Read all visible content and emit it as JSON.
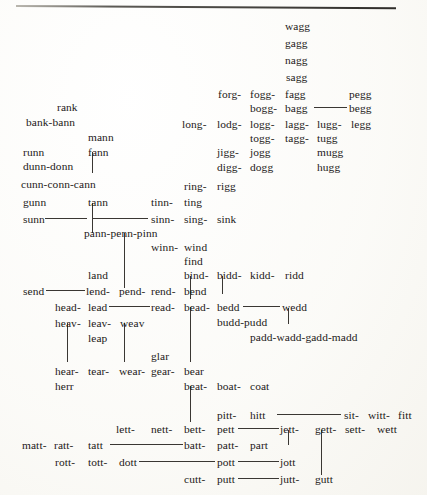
{
  "page": {
    "kind": "scanned-book-diagram",
    "width": 427,
    "height": 495,
    "ink_color": "#232018",
    "rule_color": "#3a3733",
    "paper_color": "#fdfdfb"
  },
  "top_rule": {
    "present": true,
    "x": 16,
    "y": 5,
    "width": 380
  },
  "words": [
    {
      "t": "wagg",
      "x": 285,
      "y": 20
    },
    {
      "t": "gagg",
      "x": 285,
      "y": 37
    },
    {
      "t": "nagg",
      "x": 285,
      "y": 54
    },
    {
      "t": "sagg",
      "x": 286,
      "y": 71
    },
    {
      "t": "forg-",
      "x": 218,
      "y": 88
    },
    {
      "t": "fogg-",
      "x": 250,
      "y": 88
    },
    {
      "t": "fagg",
      "x": 285,
      "y": 88
    },
    {
      "t": "pegg",
      "x": 349,
      "y": 88
    },
    {
      "t": "rank",
      "x": 57,
      "y": 101
    },
    {
      "t": "bogg-",
      "x": 250,
      "y": 102
    },
    {
      "t": "bagg",
      "x": 285,
      "y": 102
    },
    {
      "t": "begg",
      "x": 349,
      "y": 102
    },
    {
      "t": "bank-bann",
      "x": 26,
      "y": 116
    },
    {
      "t": "long-",
      "x": 182,
      "y": 118
    },
    {
      "t": "lodg-",
      "x": 217,
      "y": 118
    },
    {
      "t": "logg-",
      "x": 250,
      "y": 118
    },
    {
      "t": "lagg-",
      "x": 285,
      "y": 118
    },
    {
      "t": "lugg-",
      "x": 317,
      "y": 118
    },
    {
      "t": "legg",
      "x": 351,
      "y": 118
    },
    {
      "t": "mann",
      "x": 88,
      "y": 131
    },
    {
      "t": "togg-",
      "x": 250,
      "y": 132
    },
    {
      "t": "tagg-",
      "x": 285,
      "y": 132
    },
    {
      "t": "tugg",
      "x": 317,
      "y": 132
    },
    {
      "t": "runn",
      "x": 23,
      "y": 146
    },
    {
      "t": "fann",
      "x": 88,
      "y": 146
    },
    {
      "t": "jigg-",
      "x": 217,
      "y": 146
    },
    {
      "t": "jogg",
      "x": 250,
      "y": 146
    },
    {
      "t": "mugg",
      "x": 317,
      "y": 146
    },
    {
      "t": "dunn-donn",
      "x": 23,
      "y": 160
    },
    {
      "t": "digg-",
      "x": 217,
      "y": 161
    },
    {
      "t": "dogg",
      "x": 250,
      "y": 161
    },
    {
      "t": "hugg",
      "x": 317,
      "y": 161
    },
    {
      "t": "cunn-conn-cann",
      "x": 21,
      "y": 178
    },
    {
      "t": "ring-",
      "x": 184,
      "y": 180
    },
    {
      "t": "rigg",
      "x": 217,
      "y": 180
    },
    {
      "t": "gunn",
      "x": 23,
      "y": 196
    },
    {
      "t": "tann",
      "x": 88,
      "y": 196
    },
    {
      "t": "tinn-",
      "x": 151,
      "y": 196
    },
    {
      "t": "ting",
      "x": 184,
      "y": 196
    },
    {
      "t": "sunn",
      "x": 23,
      "y": 213
    },
    {
      "t": "sinn-",
      "x": 151,
      "y": 213
    },
    {
      "t": "sing-",
      "x": 184,
      "y": 213
    },
    {
      "t": "sink",
      "x": 217,
      "y": 213
    },
    {
      "t": "pann-penn-pinn",
      "x": 84,
      "y": 227
    },
    {
      "t": "winn-",
      "x": 151,
      "y": 241
    },
    {
      "t": "wind",
      "x": 184,
      "y": 241
    },
    {
      "t": "find",
      "x": 184,
      "y": 255
    },
    {
      "t": "land",
      "x": 88,
      "y": 269
    },
    {
      "t": "bind-",
      "x": 184,
      "y": 269
    },
    {
      "t": "bidd-",
      "x": 217,
      "y": 269
    },
    {
      "t": "kidd-",
      "x": 250,
      "y": 269
    },
    {
      "t": "ridd",
      "x": 285,
      "y": 269
    },
    {
      "t": "send",
      "x": 23,
      "y": 285
    },
    {
      "t": "lend-",
      "x": 86,
      "y": 285
    },
    {
      "t": "pend-",
      "x": 119,
      "y": 285
    },
    {
      "t": "rend-",
      "x": 151,
      "y": 285
    },
    {
      "t": "bend",
      "x": 184,
      "y": 285
    },
    {
      "t": "head-",
      "x": 55,
      "y": 301
    },
    {
      "t": "lead",
      "x": 88,
      "y": 301
    },
    {
      "t": "read-",
      "x": 151,
      "y": 301
    },
    {
      "t": "bead-",
      "x": 184,
      "y": 301
    },
    {
      "t": "bedd",
      "x": 217,
      "y": 301
    },
    {
      "t": "wedd",
      "x": 282,
      "y": 301
    },
    {
      "t": "heav-",
      "x": 55,
      "y": 317
    },
    {
      "t": "leav-",
      "x": 88,
      "y": 317
    },
    {
      "t": "weav",
      "x": 120,
      "y": 317
    },
    {
      "t": "budd-pudd",
      "x": 217,
      "y": 316
    },
    {
      "t": "leap",
      "x": 88,
      "y": 332
    },
    {
      "t": "padd-wadd-gadd-madd",
      "x": 250,
      "y": 331
    },
    {
      "t": "glar",
      "x": 151,
      "y": 350
    },
    {
      "t": "hear-",
      "x": 55,
      "y": 365
    },
    {
      "t": "tear-",
      "x": 88,
      "y": 365
    },
    {
      "t": "wear-",
      "x": 119,
      "y": 365
    },
    {
      "t": "gear-",
      "x": 151,
      "y": 365
    },
    {
      "t": "bear",
      "x": 184,
      "y": 365
    },
    {
      "t": "herr",
      "x": 55,
      "y": 380
    },
    {
      "t": "beat-",
      "x": 184,
      "y": 380
    },
    {
      "t": "boat-",
      "x": 217,
      "y": 380
    },
    {
      "t": "coat",
      "x": 250,
      "y": 380
    },
    {
      "t": "pitt-",
      "x": 217,
      "y": 409
    },
    {
      "t": "hitt",
      "x": 250,
      "y": 409
    },
    {
      "t": "sit-",
      "x": 344,
      "y": 409
    },
    {
      "t": "witt-",
      "x": 368,
      "y": 409
    },
    {
      "t": "fitt",
      "x": 398,
      "y": 409
    },
    {
      "t": "lett-",
      "x": 116,
      "y": 423
    },
    {
      "t": "nett-",
      "x": 151,
      "y": 423
    },
    {
      "t": "bett-",
      "x": 184,
      "y": 423
    },
    {
      "t": "pett",
      "x": 217,
      "y": 423
    },
    {
      "t": "jett-",
      "x": 280,
      "y": 423
    },
    {
      "t": "gett-",
      "x": 315,
      "y": 423
    },
    {
      "t": "sett-",
      "x": 345,
      "y": 423
    },
    {
      "t": "wett",
      "x": 377,
      "y": 423
    },
    {
      "t": "matt-",
      "x": 22,
      "y": 439
    },
    {
      "t": "ratt-",
      "x": 54,
      "y": 439
    },
    {
      "t": "tatt",
      "x": 88,
      "y": 439
    },
    {
      "t": "batt-",
      "x": 184,
      "y": 439
    },
    {
      "t": "patt-",
      "x": 217,
      "y": 439
    },
    {
      "t": "part",
      "x": 250,
      "y": 439
    },
    {
      "t": "rott-",
      "x": 55,
      "y": 456
    },
    {
      "t": "tott-",
      "x": 88,
      "y": 456
    },
    {
      "t": "dott",
      "x": 119,
      "y": 456
    },
    {
      "t": "pott",
      "x": 217,
      "y": 456
    },
    {
      "t": "jott",
      "x": 280,
      "y": 456
    },
    {
      "t": "cutt-",
      "x": 184,
      "y": 473
    },
    {
      "t": "putt",
      "x": 217,
      "y": 473
    },
    {
      "t": "jutt-",
      "x": 280,
      "y": 473
    },
    {
      "t": "gutt",
      "x": 315,
      "y": 473
    }
  ],
  "hlines": [
    {
      "x": 314,
      "y": 107,
      "w": 33
    },
    {
      "x": 45,
      "y": 218,
      "w": 42
    },
    {
      "x": 92,
      "y": 218,
      "w": 56
    },
    {
      "x": 46,
      "y": 290,
      "w": 39
    },
    {
      "x": 109,
      "y": 306,
      "w": 41
    },
    {
      "x": 243,
      "y": 306,
      "w": 37
    },
    {
      "x": 277,
      "y": 414,
      "w": 64
    },
    {
      "x": 238,
      "y": 428,
      "w": 41
    },
    {
      "x": 110,
      "y": 444,
      "w": 73
    },
    {
      "x": 139,
      "y": 461,
      "w": 76
    },
    {
      "x": 238,
      "y": 461,
      "w": 41
    },
    {
      "x": 238,
      "y": 478,
      "w": 41
    }
  ],
  "vlines": [
    {
      "x": 92,
      "y": 152,
      "h": 21
    },
    {
      "x": 92,
      "y": 203,
      "h": 30
    },
    {
      "x": 124,
      "y": 233,
      "h": 55
    },
    {
      "x": 124,
      "y": 323,
      "h": 39
    },
    {
      "x": 67,
      "y": 323,
      "h": 39
    },
    {
      "x": 190,
      "y": 276,
      "h": 23
    },
    {
      "x": 190,
      "y": 307,
      "h": 55
    },
    {
      "x": 190,
      "y": 386,
      "h": 27
    },
    {
      "x": 190,
      "y": 386,
      "h": 36
    },
    {
      "x": 222,
      "y": 276,
      "h": 18
    },
    {
      "x": 288,
      "y": 308,
      "h": 16
    },
    {
      "x": 288,
      "y": 430,
      "h": 15
    },
    {
      "x": 321,
      "y": 430,
      "h": 45
    }
  ]
}
